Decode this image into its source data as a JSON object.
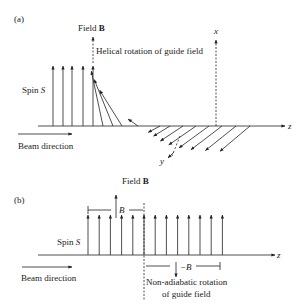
{
  "panel_a": {
    "label": "(a)",
    "field_top_label": "Field ",
    "field_top_bold": "B",
    "helical_label": "Helical rotation of guide field",
    "axis_x": "x",
    "axis_y": "y",
    "axis_z": "z",
    "spin_label": "Spin ",
    "spin_symbol": "S",
    "beam_label": "Beam direction",
    "field_bottom_label": "Field ",
    "field_bottom_bold": "B",
    "spin_angles_deg": [
      0,
      0,
      0,
      0,
      0,
      12,
      22,
      32,
      55,
      160,
      165,
      168,
      170,
      172,
      174,
      176,
      178
    ]
  },
  "panel_b": {
    "label": "(b)",
    "spin_label": "Spin ",
    "spin_symbol": "S",
    "beam_label": "Beam direction",
    "axis_z": "z",
    "field_plus_label": "B",
    "field_minus_label": "−B",
    "non_adiabatic_line1": "Non-adiabatic rotation",
    "non_adiabatic_line2": "of guide field",
    "spin_count": 13
  }
}
